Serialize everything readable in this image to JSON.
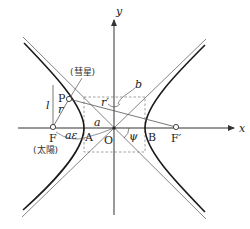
{
  "diagram": {
    "axes": {
      "x_label": "x",
      "y_label": "y",
      "origin_label": "O"
    },
    "points": {
      "F": "F",
      "F_prime": "F′",
      "P": "P",
      "A": "A",
      "B": "B"
    },
    "annotations": {
      "comet": "(彗星)",
      "sun": "(太陽)",
      "l": "l",
      "r": "r",
      "r_prime": "r′",
      "a": "a",
      "b": "b",
      "a_epsilon": "aε",
      "psi": "ψ"
    },
    "colors": {
      "curve": "#1a1a1a",
      "asymptote": "#777777",
      "axis": "#333333",
      "dashed": "#888888",
      "construction": "#555555"
    },
    "geometry": {
      "origin": [
        114,
        128
      ],
      "a_px": 30,
      "b_px": 31,
      "focus_left": [
        53,
        127
      ],
      "focus_right": [
        176,
        127
      ],
      "point_P": [
        69,
        99
      ]
    }
  }
}
